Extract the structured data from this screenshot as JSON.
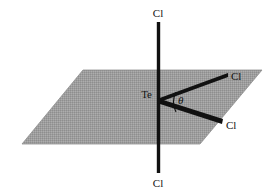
{
  "figure": {
    "background_color": "#ffffff",
    "plane": {
      "name": "equatorial-plane",
      "fill_color": "#9a9a9a",
      "stroke_color": "#8c8c8c",
      "description": "shaded parallelogram representing the equatorial plane"
    },
    "bond_color": "#111111",
    "central_atom": {
      "label": "Te",
      "element": "tellurium"
    },
    "ligands": [
      {
        "id": "axial-top",
        "label": "Cl",
        "position": "axial-up"
      },
      {
        "id": "axial-bottom",
        "label": "Cl",
        "position": "axial-down"
      },
      {
        "id": "equatorial-upper",
        "label": "Cl",
        "position": "equatorial-upper-right"
      },
      {
        "id": "equatorial-lower",
        "label": "Cl",
        "position": "equatorial-lower-right"
      }
    ],
    "angle": {
      "symbol": "θ",
      "name": "bond-angle-theta",
      "between": [
        "equatorial-upper",
        "equatorial-lower"
      ]
    }
  }
}
